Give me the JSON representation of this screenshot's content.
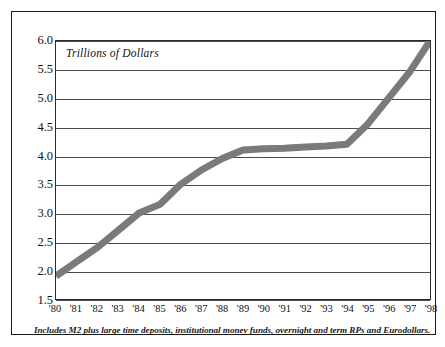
{
  "chart_data": {
    "type": "line",
    "title": "Trillions of Dollars",
    "subtitle": "",
    "xlabel": "",
    "ylabel": "",
    "ylim": [
      1.5,
      6.0
    ],
    "ytick_step": 0.5,
    "grid": true,
    "legend": "none",
    "line_color": "#7a7a7a",
    "line_width_px": 7,
    "axis_color": "#2b2b2b",
    "categories": [
      "'80",
      "'81",
      "'82",
      "'83",
      "'84",
      "'85",
      "'86",
      "'87",
      "'88",
      "'89",
      "'90",
      "'91",
      "'92",
      "'93",
      "'94",
      "'95",
      "'96",
      "'97",
      "'98"
    ],
    "x": [
      1980,
      1981,
      1982,
      1983,
      1984,
      1985,
      1986,
      1987,
      1988,
      1989,
      1990,
      1991,
      1992,
      1993,
      1994,
      1995,
      1996,
      1997,
      1998
    ],
    "values": [
      1.9,
      2.15,
      2.4,
      2.7,
      3.0,
      3.15,
      3.5,
      3.75,
      3.95,
      4.1,
      4.12,
      4.13,
      4.15,
      4.17,
      4.2,
      4.55,
      5.0,
      5.45,
      6.0
    ],
    "ytick_labels": [
      "6.0",
      "5.5",
      "5.0",
      "4.5",
      "4.0",
      "3.5",
      "3.0",
      "2.5",
      "2.0",
      "1.5"
    ],
    "ytick_values": [
      6.0,
      5.5,
      5.0,
      4.5,
      4.0,
      3.5,
      3.0,
      2.5,
      2.0,
      1.5
    ],
    "annotations": []
  },
  "footnote": {
    "text": "Includes M2 plus large time deposits, institutional money funds, overnight and term RPs and Eurodollars."
  }
}
